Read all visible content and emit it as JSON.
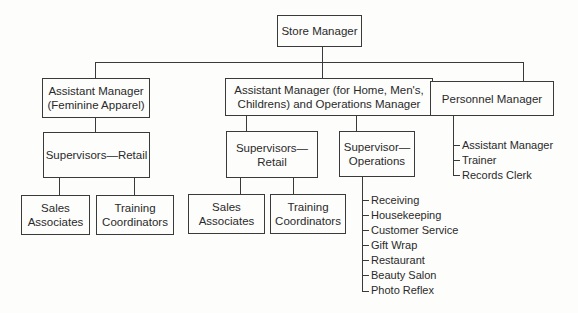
{
  "diagram": {
    "type": "organization-chart",
    "root": "Store Manager",
    "level1": {
      "feminine": "Assistant Manager\n(Feminine Apparel)",
      "operations": "Assistant Manager (for Home, Men's,\nChildrens) and Operations Manager",
      "personnel": "Personnel Manager"
    },
    "level2": {
      "fem_supervisors": "Supervisors—Retail",
      "ops_supervisors_retail": "Supervisors—\nRetail",
      "ops_supervisor_operations": "Supervisor—\nOperations"
    },
    "level3": {
      "fem_sales": "Sales\nAssociates",
      "fem_training": "Training\nCoordinators",
      "ops_sales": "Sales\nAssociates",
      "ops_training": "Training\nCoordinators"
    },
    "personnel_staff": [
      "Assistant Manager",
      "Trainer",
      "Records Clerk"
    ],
    "operations_staff": [
      "Receiving",
      "Housekeeping",
      "Customer Service",
      "Gift Wrap",
      "Restaurant",
      "Beauty Salon",
      "Photo Reflex"
    ]
  }
}
